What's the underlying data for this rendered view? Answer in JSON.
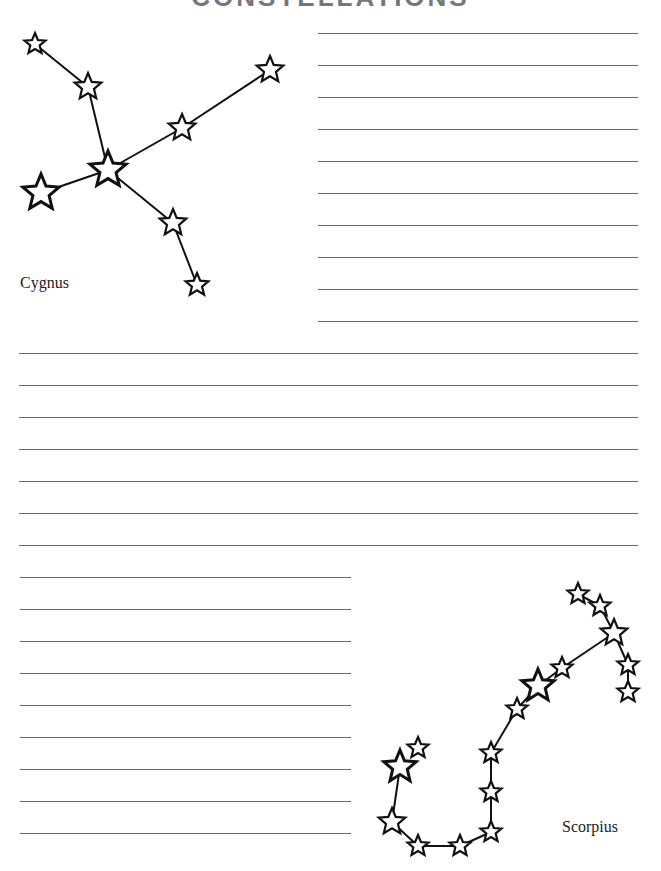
{
  "page": {
    "title": "CONSTELLATIONS",
    "line_color": "#6a6a6a",
    "star_stroke": "#111111"
  },
  "constellations": [
    {
      "name": "Cygnus",
      "label_pos": [
        20,
        274
      ],
      "stars": [
        {
          "x": 35,
          "y": 44,
          "r": 11
        },
        {
          "x": 88,
          "y": 87,
          "r": 14
        },
        {
          "x": 270,
          "y": 70,
          "r": 14
        },
        {
          "x": 182,
          "y": 128,
          "r": 14
        },
        {
          "x": 108,
          "y": 170,
          "r": 19
        },
        {
          "x": 41,
          "y": 193,
          "r": 19
        },
        {
          "x": 173,
          "y": 223,
          "r": 14
        },
        {
          "x": 197,
          "y": 285,
          "r": 12
        }
      ],
      "edges": [
        [
          0,
          1
        ],
        [
          1,
          4
        ],
        [
          4,
          3
        ],
        [
          3,
          2
        ],
        [
          4,
          5
        ],
        [
          4,
          6
        ],
        [
          6,
          7
        ]
      ]
    },
    {
      "name": "Scorpius",
      "label_pos": [
        562,
        818
      ],
      "stars": [
        {
          "x": 578,
          "y": 594,
          "r": 11
        },
        {
          "x": 600,
          "y": 606,
          "r": 11
        },
        {
          "x": 614,
          "y": 633,
          "r": 14
        },
        {
          "x": 628,
          "y": 665,
          "r": 11
        },
        {
          "x": 628,
          "y": 692,
          "r": 11
        },
        {
          "x": 562,
          "y": 668,
          "r": 11
        },
        {
          "x": 538,
          "y": 686,
          "r": 17
        },
        {
          "x": 517,
          "y": 709,
          "r": 11
        },
        {
          "x": 491,
          "y": 753,
          "r": 11
        },
        {
          "x": 491,
          "y": 792,
          "r": 11
        },
        {
          "x": 491,
          "y": 832,
          "r": 11
        },
        {
          "x": 460,
          "y": 846,
          "r": 11
        },
        {
          "x": 418,
          "y": 846,
          "r": 11
        },
        {
          "x": 392,
          "y": 822,
          "r": 14
        },
        {
          "x": 400,
          "y": 767,
          "r": 17
        },
        {
          "x": 418,
          "y": 748,
          "r": 11
        }
      ],
      "edges": [
        [
          0,
          1
        ],
        [
          1,
          2
        ],
        [
          2,
          3
        ],
        [
          3,
          4
        ],
        [
          2,
          5
        ],
        [
          5,
          6
        ],
        [
          6,
          7
        ],
        [
          7,
          8
        ],
        [
          8,
          9
        ],
        [
          9,
          10
        ],
        [
          10,
          11
        ],
        [
          11,
          12
        ],
        [
          12,
          13
        ],
        [
          13,
          14
        ]
      ]
    }
  ],
  "writing_lines": {
    "top_right": {
      "x1": 318,
      "x2": 638,
      "ys": [
        33,
        65,
        97,
        129,
        161,
        193,
        225,
        257,
        289,
        321
      ]
    },
    "full_width": {
      "x1": 19,
      "x2": 638,
      "ys": [
        353,
        385,
        417,
        449,
        481,
        513,
        545
      ]
    },
    "bottom_left": {
      "x1": 20,
      "x2": 351,
      "ys": [
        577,
        609,
        641,
        673,
        705,
        737,
        769,
        801,
        833
      ]
    }
  }
}
